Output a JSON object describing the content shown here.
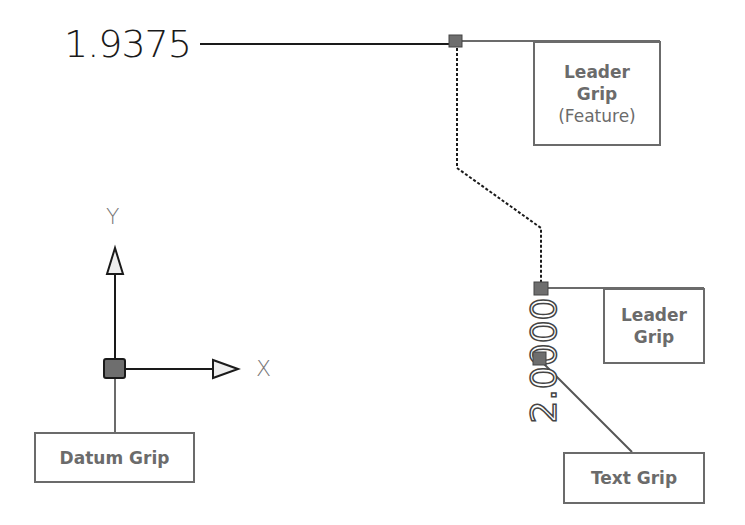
{
  "dimensions": {
    "horizontal_value": "1.9375",
    "vertical_value": "2.0000"
  },
  "labels": {
    "leader_grip_feature": {
      "line1": "Leader",
      "line2": "Grip",
      "line3": "(Feature)"
    },
    "leader_grip": {
      "line1": "Leader",
      "line2": "Grip"
    },
    "text_grip": "Text Grip",
    "datum_grip": "Datum Grip"
  },
  "axes": {
    "x_label": "X",
    "y_label": "Y"
  },
  "colors": {
    "grip_fill": "#6e6e6e",
    "label_gray": "#6b6b6b",
    "leader_line": "#1a1a1a"
  }
}
